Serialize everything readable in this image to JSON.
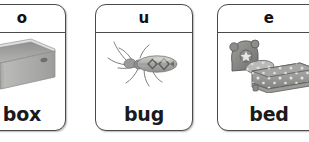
{
  "background_color": "#ffffff",
  "flashcards": [
    {
      "letter": "o",
      "word": "box",
      "image_name": "open-cardboard-box-illustration",
      "cropped": "left"
    },
    {
      "letter": "u",
      "word": "bug",
      "image_name": "beetle-bug-photo",
      "cropped": "none"
    },
    {
      "letter": "e",
      "word": "bed",
      "image_name": "bed-with-star-pattern-bedding-photo",
      "cropped": "right"
    }
  ],
  "style": {
    "card_border_color": "#4a4a4a",
    "letter_color": "#111111",
    "word_color": "#1a1a1a"
  }
}
